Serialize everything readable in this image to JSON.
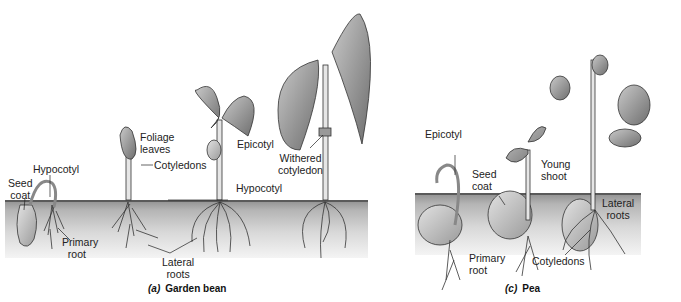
{
  "figure": {
    "panels": [
      {
        "id": "a",
        "caption_letter": "(a)",
        "caption_text": "Garden bean",
        "labels": {
          "seed_coat": "Seed\ncoat",
          "hypocotyl_1": "Hypocotyl",
          "primary_root": "Primary\nroot",
          "foliage_leaves": "Foliage\nleaves",
          "cotyledons": "Cotyledons",
          "epicotyl": "Epicotyl",
          "hypocotyl_2": "Hypocotyl",
          "lateral_roots": "Lateral\nroots",
          "withered_cotyledon": "Withered\ncotyledon"
        }
      },
      {
        "id": "c",
        "caption_letter": "(c)",
        "caption_text": "Pea",
        "labels": {
          "epicotyl": "Epicotyl",
          "seed_coat": "Seed\ncoat",
          "young_shoot": "Young\nshoot",
          "primary_root": "Primary\nroot",
          "cotyledons": "Cotyledons",
          "lateral_roots": "Lateral\nroots"
        }
      }
    ],
    "colors": {
      "ink": "#222222",
      "soil_top": "#8f8f8f",
      "leaf_fill": "#9a9a9a",
      "stem_fill": "#e6e6e6"
    }
  }
}
